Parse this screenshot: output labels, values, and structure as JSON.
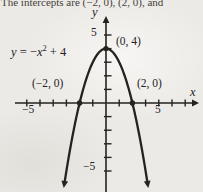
{
  "page": {
    "caption_fragment": "The intercepts are (−2, 0), (2, 0), and"
  },
  "colors": {
    "ink": "#26221e",
    "paper": "#eceae6",
    "caption_ink": "#45413b"
  },
  "chart_data": {
    "type": "line",
    "equation": "y = −x² + 4",
    "equation_label": {
      "lhs": "y",
      "rel": " = −",
      "var": "x",
      "exp": "2",
      "rest": " + 4"
    },
    "curve": {
      "fn": "quadratic",
      "a": -1,
      "b": 0,
      "c": 4,
      "x_range": [
        -3.12,
        3.12
      ]
    },
    "axes": {
      "x_label": "x",
      "y_label": "y",
      "x_tick_range": [
        -6,
        6
      ],
      "y_tick_range": [
        -5,
        5
      ],
      "tick_step": 1,
      "x_axis_labels": [
        {
          "value": -5,
          "label": "−5"
        },
        {
          "value": 5,
          "label": "5"
        }
      ],
      "y_axis_labels": [
        {
          "value": 5,
          "label": "5"
        },
        {
          "value": -5,
          "label": "−5"
        }
      ],
      "grid": false
    },
    "points": [
      {
        "x": -2,
        "y": 0,
        "label": "(−2, 0)"
      },
      {
        "x": 0,
        "y": 4,
        "label": "(0, 4)"
      },
      {
        "x": 2,
        "y": 0,
        "label": "(2, 0)"
      }
    ]
  }
}
